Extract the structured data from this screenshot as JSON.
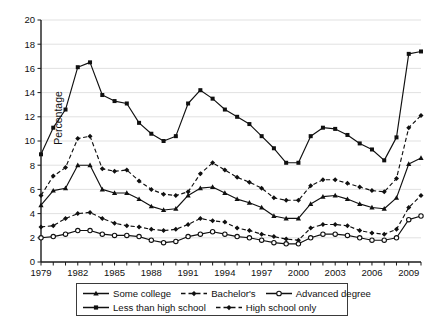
{
  "chart_data": {
    "type": "line",
    "title": "",
    "xlabel": "",
    "ylabel": "Percentage",
    "ylim": [
      0,
      20
    ],
    "ytick_step": 2,
    "xlim": [
      1979,
      2010
    ],
    "xtick_step": 3,
    "grid": true,
    "legend_position": "bottom",
    "x": [
      1979,
      1980,
      1981,
      1982,
      1983,
      1984,
      1985,
      1986,
      1987,
      1988,
      1989,
      1990,
      1991,
      1992,
      1993,
      1994,
      1995,
      1996,
      1997,
      1998,
      1999,
      2000,
      2001,
      2002,
      2003,
      2004,
      2005,
      2006,
      2007,
      2008,
      2009,
      2010
    ],
    "ytick_labels": [
      "0",
      "2",
      "4",
      "6",
      "8",
      "10",
      "12",
      "14",
      "16",
      "18",
      "20"
    ],
    "xtick_labels": [
      "1979",
      "1982",
      "1985",
      "1988",
      "1991",
      "1994",
      "1997",
      "2000",
      "2003",
      "2006",
      "2009"
    ],
    "series": [
      {
        "name": "Less than high school",
        "style": "solid",
        "marker": "square",
        "values": [
          8.9,
          11.1,
          12.6,
          16.1,
          16.5,
          13.8,
          13.3,
          13.1,
          11.5,
          10.6,
          10.0,
          10.4,
          13.1,
          14.2,
          13.5,
          12.6,
          12.0,
          11.4,
          10.4,
          9.4,
          8.2,
          8.2,
          10.4,
          11.1,
          11.0,
          10.5,
          9.8,
          9.3,
          8.4,
          10.3,
          17.2,
          17.4
        ]
      },
      {
        "name": "High school only",
        "style": "dashed",
        "marker": "diamond",
        "values": [
          5.5,
          7.1,
          7.8,
          10.2,
          10.4,
          7.7,
          7.5,
          7.6,
          6.7,
          6.0,
          5.6,
          5.5,
          5.8,
          7.3,
          8.2,
          7.6,
          7.0,
          6.6,
          6.1,
          5.3,
          5.1,
          5.1,
          6.3,
          6.8,
          6.8,
          6.5,
          6.2,
          5.9,
          5.8,
          6.9,
          11.1,
          12.1
        ]
      },
      {
        "name": "Some college",
        "style": "solid",
        "marker": "triangle",
        "values": [
          4.7,
          5.9,
          6.1,
          8.0,
          8.0,
          6.0,
          5.7,
          5.7,
          5.2,
          4.6,
          4.3,
          4.4,
          5.5,
          6.1,
          6.2,
          5.7,
          5.2,
          4.9,
          4.5,
          3.8,
          3.6,
          3.6,
          4.8,
          5.4,
          5.5,
          5.2,
          4.8,
          4.5,
          4.4,
          5.3,
          8.1,
          8.6
        ]
      },
      {
        "name": "Bachelor's",
        "style": "dashed",
        "marker": "diamond",
        "values": [
          2.9,
          3.0,
          3.6,
          4.0,
          4.1,
          3.6,
          3.2,
          3.0,
          2.9,
          2.7,
          2.6,
          2.7,
          3.1,
          3.6,
          3.4,
          3.3,
          2.8,
          2.6,
          2.3,
          2.1,
          1.9,
          1.8,
          2.8,
          3.1,
          3.1,
          3.0,
          2.6,
          2.4,
          2.3,
          2.7,
          4.5,
          5.5
        ]
      },
      {
        "name": "Advanced degree",
        "style": "solid",
        "marker": "circle-open",
        "values": [
          2.0,
          2.1,
          2.3,
          2.6,
          2.6,
          2.3,
          2.2,
          2.2,
          2.1,
          1.8,
          1.6,
          1.7,
          2.1,
          2.3,
          2.5,
          2.3,
          2.1,
          2.0,
          1.8,
          1.6,
          1.5,
          1.5,
          2.0,
          2.3,
          2.3,
          2.2,
          2.0,
          1.8,
          1.8,
          2.0,
          3.5,
          3.8
        ]
      }
    ]
  },
  "legend": {
    "rows": [
      [
        {
          "label": "Some college",
          "style": "solid",
          "marker": "triangle"
        },
        {
          "label": "Bachelor's",
          "style": "dashed",
          "marker": "diamond"
        },
        {
          "label": "Advanced degree",
          "style": "solid",
          "marker": "circle-open"
        }
      ],
      [
        {
          "label": "Less than high school",
          "style": "solid",
          "marker": "square"
        },
        {
          "label": "High school only",
          "style": "dashed",
          "marker": "diamond"
        }
      ]
    ]
  },
  "colors": {
    "line": "#101010",
    "grid": "#d9d9d9",
    "axis": "#1a1a1a",
    "text": "#111111",
    "background": "#ffffff"
  }
}
